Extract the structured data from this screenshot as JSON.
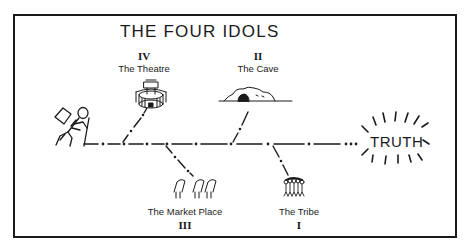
{
  "diagram": {
    "title": "THE FOUR IDOLS",
    "goal": "TRUTH",
    "idols": [
      {
        "numeral": "IV",
        "label": "The Theatre",
        "icon": "theatre-icon",
        "position": "above"
      },
      {
        "numeral": "II",
        "label": "The Cave",
        "icon": "cave-icon",
        "position": "above"
      },
      {
        "numeral": "III",
        "label": "The Market Place",
        "icon": "market-stalls-icon",
        "position": "below"
      },
      {
        "numeral": "I",
        "label": "The Tribe",
        "icon": "crowd-icon",
        "position": "below"
      }
    ],
    "start_figure": "hiker-icon",
    "colors": {
      "ink": "#1a1a1a",
      "background": "#ffffff"
    }
  }
}
